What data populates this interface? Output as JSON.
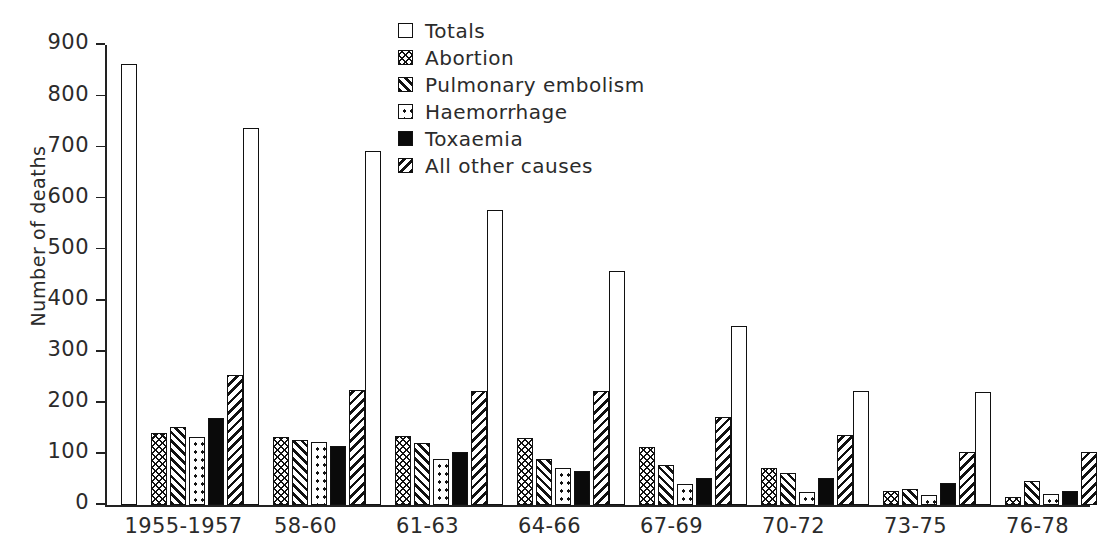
{
  "chart_data": {
    "type": "bar",
    "title": "",
    "xlabel": "",
    "ylabel": "Number of deaths",
    "ylim": [
      0,
      900
    ],
    "ytick_step": 100,
    "yticks": [
      0,
      100,
      200,
      300,
      400,
      500,
      600,
      700,
      800,
      900
    ],
    "ytick_labels": [
      "0",
      "100",
      "200",
      "300",
      "400",
      "500",
      "600",
      "700",
      "800",
      "900"
    ],
    "grid": false,
    "legend_position": "top-center",
    "categories": [
      "1955-1957",
      "58-60",
      "61-63",
      "64-66",
      "67-69",
      "70-72",
      "73-75",
      "76-78"
    ],
    "series": [
      {
        "name": "Totals",
        "pattern": "open-white",
        "values": [
          862,
          738,
          693,
          578,
          457,
          350,
          224,
          221
        ]
      },
      {
        "name": "Abortion",
        "pattern": "cross-hatch-dense",
        "values": [
          140,
          133,
          136,
          132,
          113,
          73,
          27,
          15
        ]
      },
      {
        "name": "Pulmonary embolism",
        "pattern": "diagonal-forward",
        "values": [
          152,
          127,
          121,
          91,
          78,
          62,
          31,
          47
        ]
      },
      {
        "name": "Haemorrhage",
        "pattern": "sparse-dots",
        "values": [
          134,
          124,
          91,
          72,
          42,
          26,
          20,
          22
        ]
      },
      {
        "name": "Toxaemia",
        "pattern": "solid-black",
        "values": [
          170,
          115,
          104,
          67,
          53,
          52,
          44,
          28
        ]
      },
      {
        "name": "All other causes",
        "pattern": "diagonal-back",
        "values": [
          255,
          225,
          224,
          223,
          172,
          137,
          104,
          103
        ]
      }
    ]
  },
  "legend": {
    "items": [
      {
        "label": "Totals",
        "pattern": "pat-totals"
      },
      {
        "label": "Abortion",
        "pattern": "pat-abortion"
      },
      {
        "label": "Pulmonary embolism",
        "pattern": "pat-pulmonary"
      },
      {
        "label": "Haemorrhage",
        "pattern": "pat-haemorrhage"
      },
      {
        "label": "Toxaemia",
        "pattern": "pat-toxaemia"
      },
      {
        "label": "All other causes",
        "pattern": "pat-allother"
      }
    ]
  },
  "colors": {
    "ink": "#111111",
    "background": "#ffffff",
    "text": "#2b2b2b"
  }
}
